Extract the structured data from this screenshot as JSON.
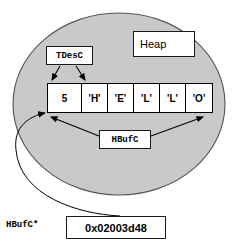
{
  "diagram": {
    "region": {
      "name": "heap-region",
      "label": "Heap",
      "shape": "ellipse",
      "fill_color": "#c9c9c9",
      "stroke_color": "#4d4d4d"
    },
    "descriptor_label": {
      "name": "tdesc-label",
      "text": "TDesC",
      "arrow_count": 2,
      "points_to": [
        "cell-0",
        "cell-1"
      ]
    },
    "buffer_label": {
      "name": "hbufc-label",
      "text": "HBufC",
      "arrow_count": 2,
      "points_to": [
        "buffer-left-edge",
        "buffer-right-edge"
      ]
    },
    "pointer_label": {
      "name": "hbufc-pointer-label",
      "text": "HBufC*"
    },
    "pointer_value": {
      "name": "pointer-address-box",
      "text": "0x02003d48",
      "points_to": "buffer-left-edge"
    },
    "buffer": {
      "name": "hbufc-buffer",
      "cells": [
        {
          "value": "5",
          "kind": "length",
          "width": "wide"
        },
        {
          "value": "'H'",
          "kind": "char",
          "width": "narrow"
        },
        {
          "value": "'E'",
          "kind": "char",
          "width": "narrow"
        },
        {
          "value": "'L'",
          "kind": "char",
          "width": "narrow"
        },
        {
          "value": "'L'",
          "kind": "char",
          "width": "narrow"
        },
        {
          "value": "'O'",
          "kind": "char",
          "width": "narrow"
        }
      ]
    },
    "colors": {
      "ink": "#000000",
      "heap_fill": "#c9c9c9",
      "box_fill": "#ffffff"
    }
  }
}
